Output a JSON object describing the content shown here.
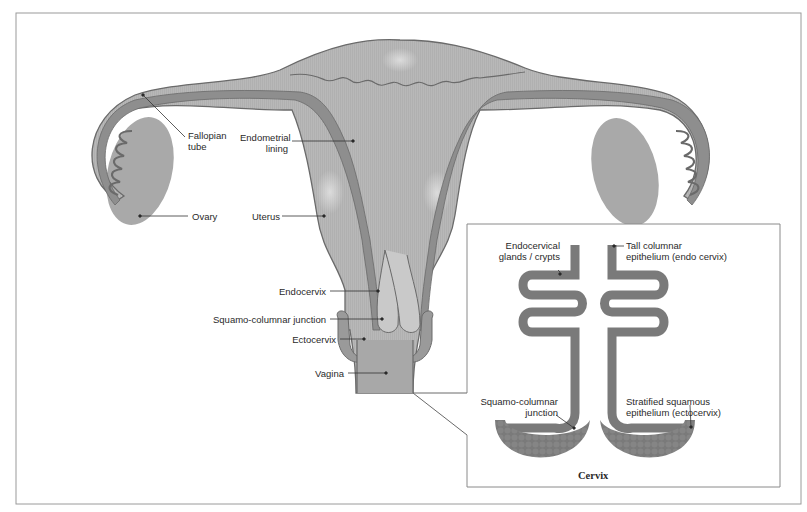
{
  "diagram": {
    "colors": {
      "tissue": "#b3b3b3",
      "tissue_light": "#c6c6c6",
      "lining": "#8e8e8e",
      "outline": "#6a6a6a",
      "epithelium": "#7d7d7d",
      "frame": "#8a8a8a",
      "text": "#2a2a2a"
    },
    "labels": {
      "fallopian_tube": [
        "Fallopian",
        "tube"
      ],
      "endometrial_lining": [
        "Endometrial",
        "lining"
      ],
      "ovary": "Ovary",
      "uterus": "Uterus",
      "endocervix": "Endocervix",
      "squamo_columnar_junction": "Squamo-columnar junction",
      "ectocervix": "Ectocervix",
      "vagina": "Vagina"
    },
    "inset": {
      "title": "Cervix",
      "labels": {
        "endocervical_glands": [
          "Endocervical",
          "glands / crypts"
        ],
        "tall_columnar": [
          "Tall columnar",
          "epithelium (endo cervix)"
        ],
        "squamo_columnar_junction": [
          "Squamo-columnar",
          "junction"
        ],
        "stratified_squamous": [
          "Stratified squamous",
          "epithelium (ectocervix)"
        ]
      }
    }
  }
}
